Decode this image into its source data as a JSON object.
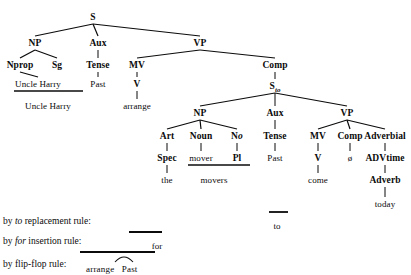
{
  "diagram": {
    "ink_color": "#0b0b0b",
    "background": "#ffffff"
  },
  "tree": {
    "nodes": [
      {
        "id": "S",
        "label": "S",
        "x": 93,
        "y": 12,
        "kind": "category"
      },
      {
        "id": "NP1",
        "label": "NP",
        "x": 35,
        "y": 38,
        "kind": "category"
      },
      {
        "id": "Aux1",
        "label": "Aux",
        "x": 98,
        "y": 38,
        "kind": "category"
      },
      {
        "id": "VP1",
        "label": "VP",
        "x": 200,
        "y": 38,
        "kind": "category"
      },
      {
        "id": "Nprop",
        "label": "Nprop",
        "x": 20,
        "y": 60,
        "kind": "category"
      },
      {
        "id": "Sg",
        "label": "Sg",
        "x": 57,
        "y": 60,
        "kind": "category"
      },
      {
        "id": "Tense1",
        "label": "Tense",
        "x": 98,
        "y": 60,
        "kind": "category"
      },
      {
        "id": "MV1",
        "label": "MV",
        "x": 137,
        "y": 60,
        "kind": "category"
      },
      {
        "id": "Comp1",
        "label": "Comp",
        "x": 275,
        "y": 60,
        "kind": "category"
      },
      {
        "id": "UncleHarry1",
        "label": "Uncle Harry",
        "x": 38,
        "y": 79,
        "kind": "terminal"
      },
      {
        "id": "Past1",
        "label": "Past",
        "x": 98,
        "y": 79,
        "kind": "terminal"
      },
      {
        "id": "V1",
        "label": "V",
        "x": 137,
        "y": 79,
        "kind": "category"
      },
      {
        "id": "Sto",
        "label": "S",
        "sub": "to",
        "x": 275,
        "y": 81,
        "kind": "category"
      },
      {
        "id": "UncleHarry2",
        "label": "Uncle Harry",
        "x": 48,
        "y": 101,
        "kind": "terminal"
      },
      {
        "id": "arrange",
        "label": "arrange",
        "x": 137,
        "y": 101,
        "kind": "terminal"
      },
      {
        "id": "NP2",
        "label": "NP",
        "x": 200,
        "y": 108,
        "kind": "category"
      },
      {
        "id": "Aux2",
        "label": "Aux",
        "x": 275,
        "y": 108,
        "kind": "category"
      },
      {
        "id": "VP2",
        "label": "VP",
        "x": 347,
        "y": 108,
        "kind": "category"
      },
      {
        "id": "Art",
        "label": "Art",
        "x": 167,
        "y": 131,
        "kind": "category"
      },
      {
        "id": "Noun",
        "label": "Noun",
        "x": 201,
        "y": 131,
        "kind": "category"
      },
      {
        "id": "No",
        "label": "N",
        "ital": "o",
        "x": 237,
        "y": 131,
        "kind": "category"
      },
      {
        "id": "Tense2",
        "label": "Tense",
        "x": 275,
        "y": 131,
        "kind": "category"
      },
      {
        "id": "MV2",
        "label": "MV",
        "x": 318,
        "y": 131,
        "kind": "category"
      },
      {
        "id": "Comp2",
        "label": "Comp",
        "x": 350,
        "y": 131,
        "kind": "category"
      },
      {
        "id": "Adverbial",
        "label": "Adverbial",
        "x": 385,
        "y": 131,
        "kind": "category"
      },
      {
        "id": "Spec",
        "label": "Spec",
        "x": 167,
        "y": 153,
        "kind": "category"
      },
      {
        "id": "mover",
        "label": "mover",
        "x": 201,
        "y": 153,
        "kind": "terminal"
      },
      {
        "id": "Pl",
        "label": "Pl",
        "x": 237,
        "y": 153,
        "kind": "category"
      },
      {
        "id": "Past2",
        "label": "Past",
        "x": 275,
        "y": 153,
        "kind": "terminal"
      },
      {
        "id": "V2",
        "label": "V",
        "x": 318,
        "y": 153,
        "kind": "category"
      },
      {
        "id": "null",
        "label": "ø",
        "x": 350,
        "y": 153,
        "kind": "terminal"
      },
      {
        "id": "ADVtime",
        "label": "ADVtime",
        "x": 385,
        "y": 153,
        "kind": "category"
      },
      {
        "id": "the",
        "label": "the",
        "x": 167,
        "y": 175,
        "kind": "terminal"
      },
      {
        "id": "movers",
        "label": "movers",
        "x": 214,
        "y": 175,
        "kind": "terminal"
      },
      {
        "id": "come",
        "label": "come",
        "x": 318,
        "y": 175,
        "kind": "terminal"
      },
      {
        "id": "Adverb",
        "label": "Adverb",
        "x": 385,
        "y": 175,
        "kind": "category"
      },
      {
        "id": "today",
        "label": "today",
        "x": 385,
        "y": 199,
        "kind": "terminal"
      }
    ],
    "edges": [
      {
        "from": "S",
        "to": "NP1"
      },
      {
        "from": "S",
        "to": "Aux1"
      },
      {
        "from": "S",
        "to": "VP1"
      },
      {
        "from": "NP1",
        "to": "Nprop"
      },
      {
        "from": "NP1",
        "to": "Sg"
      },
      {
        "from": "Aux1",
        "to": "Tense1"
      },
      {
        "from": "VP1",
        "to": "MV1"
      },
      {
        "from": "VP1",
        "to": "Comp1"
      },
      {
        "from": "Nprop",
        "to": "UncleHarry1"
      },
      {
        "from": "Tense1",
        "to": "Past1"
      },
      {
        "from": "MV1",
        "to": "V1"
      },
      {
        "from": "Comp1",
        "to": "Sto"
      },
      {
        "from": "V1",
        "to": "arrange"
      },
      {
        "from": "Sto",
        "to": "NP2"
      },
      {
        "from": "Sto",
        "to": "Aux2"
      },
      {
        "from": "Sto",
        "to": "VP2"
      },
      {
        "from": "NP2",
        "to": "Art"
      },
      {
        "from": "NP2",
        "to": "Noun"
      },
      {
        "from": "NP2",
        "to": "No"
      },
      {
        "from": "Aux2",
        "to": "Tense2"
      },
      {
        "from": "VP2",
        "to": "MV2"
      },
      {
        "from": "VP2",
        "to": "Comp2"
      },
      {
        "from": "VP2",
        "to": "Adverbial"
      },
      {
        "from": "Art",
        "to": "Spec"
      },
      {
        "from": "Noun",
        "to": "mover"
      },
      {
        "from": "No",
        "to": "Pl"
      },
      {
        "from": "Tense2",
        "to": "Past2"
      },
      {
        "from": "MV2",
        "to": "V2"
      },
      {
        "from": "Comp2",
        "to": "null"
      },
      {
        "from": "Adverbial",
        "to": "ADVtime"
      },
      {
        "from": "Spec",
        "to": "the"
      },
      {
        "from": "V2",
        "to": "come"
      },
      {
        "from": "ADVtime",
        "to": "Adverb"
      },
      {
        "from": "Adverb",
        "to": "today"
      }
    ],
    "agglutination_bars": [
      {
        "id": "bar-uncle-harry",
        "x1": 14,
        "x2": 83,
        "y": 91
      },
      {
        "id": "bar-movers",
        "x1": 188,
        "x2": 250,
        "y": 165
      }
    ]
  },
  "rules": [
    {
      "id": "to-replacement",
      "label_prefix": "by ",
      "label_italic": "to",
      "label_suffix": " replacement rule:",
      "label_x": 3,
      "label_y": 216,
      "output": "to",
      "output_x": 277,
      "output_y": 221,
      "bar": {
        "x1": 269,
        "x2": 288,
        "y": 212
      }
    },
    {
      "id": "for-insertion",
      "label_prefix": "by ",
      "label_italic": "for",
      "label_suffix": " insertion rule:",
      "label_x": 3,
      "label_y": 236,
      "output": "for",
      "output_x": 157,
      "output_y": 241,
      "bar": {
        "x1": 129,
        "x2": 162,
        "y": 232
      }
    },
    {
      "id": "flip-flop",
      "label_prefix": "by flip-flop rule:",
      "label_italic": "",
      "label_suffix": "",
      "label_x": 3,
      "label_y": 259,
      "output_left": "arrange",
      "output_right": "Past",
      "output_x": 86,
      "output_y": 264,
      "bar": {
        "x1": 80,
        "x2": 155,
        "y": 252
      },
      "arc": {
        "x1": 115,
        "x2": 133,
        "y": 262,
        "depth": 5
      }
    }
  ]
}
